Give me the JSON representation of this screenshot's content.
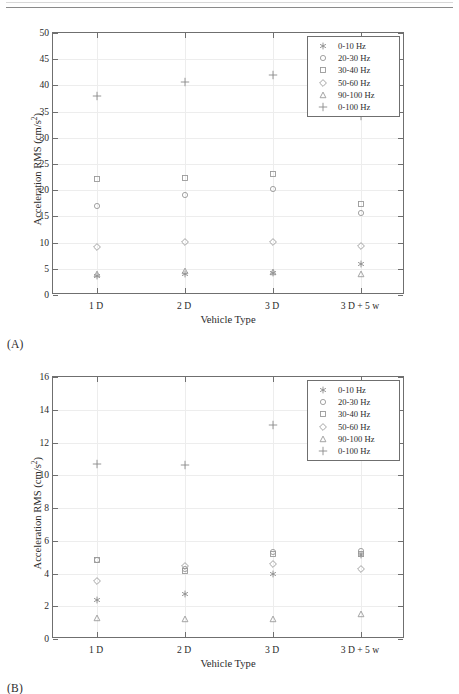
{
  "figure": {
    "panels": [
      {
        "tag": "(A)",
        "xlabel": "Vehicle Type",
        "ylabel_main": "Acceleration RMS (cm/s",
        "ylabel_sup": "2",
        "ylabel_tail": ")",
        "categories": [
          "1 D",
          "2 D",
          "3 D",
          "3 D + 5 w"
        ],
        "yticks": [
          "0",
          "5",
          "10",
          "15",
          "20",
          "25",
          "30",
          "35",
          "40",
          "45",
          "50"
        ]
      },
      {
        "tag": "(B)",
        "xlabel": "Vehicle Type",
        "ylabel_main": "Acceleration RMS (cm/s",
        "ylabel_sup": "2",
        "ylabel_tail": ")",
        "categories": [
          "1 D",
          "2 D",
          "3 D",
          "3 D + 5 w"
        ],
        "yticks": [
          "0",
          "2",
          "4",
          "6",
          "8",
          "10",
          "12",
          "14",
          "16"
        ]
      }
    ],
    "legend_entries": [
      {
        "label": "0-10 Hz",
        "marker": "asterisk-marker"
      },
      {
        "label": "20-30 Hz",
        "marker": "circle-marker"
      },
      {
        "label": "30-40 Hz",
        "marker": "square-marker"
      },
      {
        "label": "50-60 Hz",
        "marker": "diamond-marker"
      },
      {
        "label": "90-100 Hz",
        "marker": "triangle-marker"
      },
      {
        "label": "0-100 Hz",
        "marker": "plus-marker"
      }
    ]
  },
  "chart_data": [
    {
      "type": "scatter",
      "panel": "(A)",
      "title": "",
      "xlabel": "Vehicle Type",
      "ylabel": "Acceleration RMS (cm/s^2)",
      "categories": [
        "1 D",
        "2 D",
        "3 D",
        "3 D + 5 w"
      ],
      "ylim": [
        0,
        50
      ],
      "yticks": [
        0,
        5,
        10,
        15,
        20,
        25,
        30,
        35,
        40,
        45,
        50
      ],
      "grid": true,
      "legend_position": "top-right",
      "series": [
        {
          "name": "0-10 Hz",
          "marker": "asterisk",
          "values": [
            3.6,
            4.0,
            4.2,
            5.9
          ]
        },
        {
          "name": "20-30 Hz",
          "marker": "circle",
          "values": [
            16.9,
            19.0,
            20.2,
            15.7
          ]
        },
        {
          "name": "30-40 Hz",
          "marker": "square",
          "values": [
            22.2,
            22.4,
            23.0,
            17.4
          ]
        },
        {
          "name": "50-60 Hz",
          "marker": "diamond",
          "values": [
            9.1,
            10.1,
            10.1,
            9.4
          ]
        },
        {
          "name": "90-100 Hz",
          "marker": "triangle",
          "values": [
            4.0,
            4.6,
            4.3,
            4.0
          ]
        },
        {
          "name": "0-100 Hz",
          "marker": "plus",
          "values": [
            37.9,
            40.6,
            42.0,
            34.2
          ]
        }
      ]
    },
    {
      "type": "scatter",
      "panel": "(B)",
      "title": "",
      "xlabel": "Vehicle Type",
      "ylabel": "Acceleration RMS (cm/s^2)",
      "categories": [
        "1 D",
        "2 D",
        "3 D",
        "3 D + 5 w"
      ],
      "ylim": [
        0,
        16
      ],
      "yticks": [
        0,
        2,
        4,
        6,
        8,
        10,
        12,
        14,
        16
      ],
      "grid": true,
      "legend_position": "top-right",
      "series": [
        {
          "name": "0-10 Hz",
          "marker": "asterisk",
          "values": [
            2.4,
            2.75,
            3.95,
            5.15
          ]
        },
        {
          "name": "20-30 Hz",
          "marker": "circle",
          "values": [
            4.85,
            4.3,
            5.3,
            5.35
          ]
        },
        {
          "name": "30-40 Hz",
          "marker": "square",
          "values": [
            4.8,
            4.15,
            5.2,
            5.2
          ]
        },
        {
          "name": "50-60 Hz",
          "marker": "diamond",
          "values": [
            3.55,
            4.45,
            4.6,
            4.25
          ]
        },
        {
          "name": "90-100 Hz",
          "marker": "triangle",
          "values": [
            1.3,
            1.25,
            1.25,
            1.5
          ]
        },
        {
          "name": "0-100 Hz",
          "marker": "plus",
          "values": [
            10.7,
            10.65,
            13.05,
            13.4
          ]
        }
      ]
    }
  ]
}
